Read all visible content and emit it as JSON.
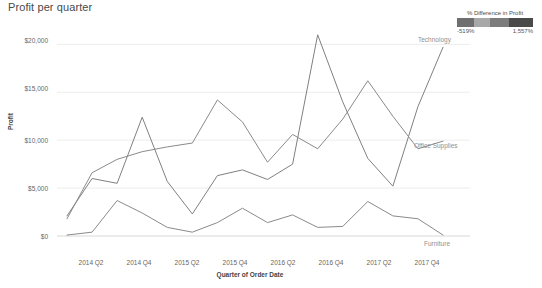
{
  "title": "Profit per quarter",
  "legend": {
    "title": "% Difference in Profit",
    "min_label": "-519%",
    "max_label": "1,557%",
    "colors": [
      "#6f6f6f",
      "#a8a8a8",
      "#7c7c7c",
      "#4a4a4a"
    ]
  },
  "axes": {
    "y_title": "Profit",
    "x_title": "Quarter of Order Date",
    "y_ticks": [
      "$0",
      "$5,000",
      "$10,000",
      "$15,000",
      "$20,000"
    ],
    "x_ticks": [
      "2014 Q2",
      "2014 Q4",
      "2015 Q2",
      "2015 Q4",
      "2016 Q2",
      "2016 Q4",
      "2017 Q2",
      "2017 Q4"
    ]
  },
  "series_labels": {
    "technology": "Technology",
    "office_supplies": "Office Supplies",
    "furniture": "Furniture"
  },
  "chart_data": {
    "type": "line",
    "title": "Profit per quarter",
    "xlabel": "Quarter of Order Date",
    "ylabel": "Profit",
    "ylim": [
      0,
      21500
    ],
    "grid": true,
    "legend_position": "top-right",
    "x": [
      "2014 Q1",
      "2014 Q2",
      "2014 Q3",
      "2014 Q4",
      "2015 Q1",
      "2015 Q2",
      "2015 Q3",
      "2015 Q4",
      "2016 Q1",
      "2016 Q2",
      "2016 Q3",
      "2016 Q4",
      "2017 Q1",
      "2017 Q2",
      "2017 Q3",
      "2017 Q4"
    ],
    "series": [
      {
        "name": "Technology",
        "color": "#808080",
        "values": [
          2100,
          6000,
          5500,
          12400,
          5700,
          2300,
          6300,
          6900,
          5900,
          7500,
          21000,
          14000,
          8100,
          5200,
          13500,
          19700
        ]
      },
      {
        "name": "Office Supplies",
        "color": "#8a8a8a",
        "values": [
          1800,
          6600,
          8000,
          8800,
          9300,
          9700,
          14200,
          11900,
          7700,
          10600,
          9100,
          12200,
          16200,
          12500,
          9100,
          9900
        ]
      },
      {
        "name": "Furniture",
        "color": "#8a8a8a",
        "values": [
          100,
          400,
          3700,
          2400,
          900,
          400,
          1400,
          2900,
          1400,
          2200,
          900,
          1000,
          3600,
          2100,
          1800,
          100
        ]
      }
    ],
    "legend_scale": {
      "name": "% Difference in Profit",
      "min": -519,
      "max": 1557,
      "min_label": "-519%",
      "max_label": "1,557%"
    }
  }
}
